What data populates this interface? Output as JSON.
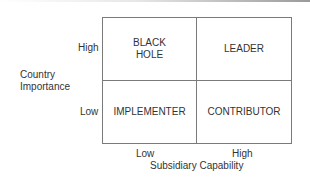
{
  "diagram": {
    "type": "2x2-matrix",
    "y_axis": {
      "label_line1": "Country",
      "label_line2": "Importance",
      "high": "High",
      "low": "Low"
    },
    "x_axis": {
      "label": "Subsidiary Capability",
      "low": "Low",
      "high": "High"
    },
    "quadrants": {
      "top_left": {
        "line1": "BLACK",
        "line2": "HOLE"
      },
      "top_right": {
        "label": "LEADER"
      },
      "bottom_left": {
        "label": "IMPLEMENTER"
      },
      "bottom_right": {
        "label": "CONTRIBUTOR"
      }
    },
    "colors": {
      "border": "#7a7a7a",
      "text": "#333333",
      "background": "#ffffff"
    }
  }
}
